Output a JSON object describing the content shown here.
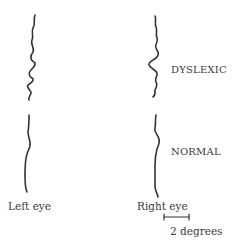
{
  "figure": {
    "rows": [
      {
        "label": "DYSLEXIC"
      },
      {
        "label": "NORMAL"
      }
    ],
    "columns": [
      {
        "label": "Left eye"
      },
      {
        "label": "Right eye"
      }
    ],
    "scale_bar": {
      "label": "2 degrees"
    },
    "trace_color": "#333333"
  }
}
